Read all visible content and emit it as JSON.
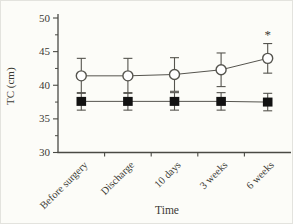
{
  "figure": {
    "background": "#fcfcf8",
    "border_color": "#e3e3de"
  },
  "chart_data": {
    "type": "line",
    "title": "",
    "xlabel": "Time",
    "ylabel": "TC (cm)",
    "ylim": [
      30,
      50
    ],
    "y_major_ticks": [
      30,
      35,
      40,
      45,
      50
    ],
    "y_minor_ticks": [
      32.5,
      37.5,
      42.5,
      47.5
    ],
    "grid": false,
    "legend": "none",
    "categories": [
      "Before surgery",
      "Discharge",
      "10 days",
      "3 weeks",
      "6 weeks"
    ],
    "series": [
      {
        "name": "open-circle-group",
        "marker": "circle-open",
        "values": [
          41.4,
          41.4,
          41.6,
          42.3,
          44.0
        ],
        "errors": [
          2.6,
          2.6,
          2.5,
          2.5,
          2.2
        ]
      },
      {
        "name": "filled-square-group",
        "marker": "square-filled",
        "values": [
          37.6,
          37.6,
          37.6,
          37.6,
          37.5
        ],
        "errors": [
          1.3,
          1.3,
          1.3,
          1.3,
          1.3
        ]
      }
    ],
    "annotations": [
      {
        "text": "*",
        "series": 0,
        "point": 4,
        "placement": "above-error-bar"
      }
    ],
    "colors": {
      "axis": "#4a4a44",
      "text": "#3b3a34",
      "line": "#55544e",
      "open_marker_fill": "#ffffff",
      "solid_marker_fill": "#121212"
    }
  }
}
